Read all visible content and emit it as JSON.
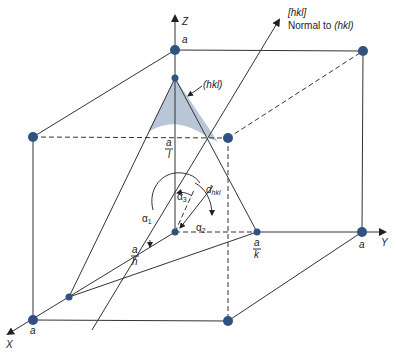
{
  "colors": {
    "node": "#2f5283",
    "plane_fill": "#b9c6d6",
    "line": "#333333",
    "background": "#ffffff"
  },
  "axes": {
    "x_label": "X",
    "y_label": "Y",
    "z_label": "Z"
  },
  "labels": {
    "a_z": "a",
    "a_x": "a",
    "a_y": "a",
    "plane": "(hkl)",
    "normal_line1": "[hkl]",
    "normal_line2_prefix": "Normal to ",
    "normal_line2_hkl": "(hkl)",
    "a_over_l_num": "a",
    "a_over_l_den": "l",
    "a_over_h_num": "a",
    "a_over_h_den": "h",
    "a_over_k_num": "a",
    "a_over_k_den": "k",
    "alpha1": "α",
    "alpha1_sub": "1",
    "alpha2": "α",
    "alpha2_sub": "2",
    "alpha3": "α",
    "alpha3_sub": "3",
    "d": "d",
    "d_sub": "hkl"
  },
  "nodes": [
    {
      "name": "origin",
      "x": 175,
      "y": 232
    },
    {
      "name": "z-a",
      "x": 175,
      "y": 50
    },
    {
      "name": "top-back-right",
      "x": 363,
      "y": 51
    },
    {
      "name": "top-front-left",
      "x": 33,
      "y": 137
    },
    {
      "name": "mid-back-right",
      "x": 228,
      "y": 138
    },
    {
      "name": "y-a",
      "x": 362,
      "y": 232
    },
    {
      "name": "x-a",
      "x": 33,
      "y": 320
    },
    {
      "name": "bottom-front-right",
      "x": 228,
      "y": 321
    },
    {
      "name": "a-over-l",
      "x": 175,
      "y": 78
    },
    {
      "name": "a-over-h",
      "x": 69,
      "y": 297
    },
    {
      "name": "a-over-k",
      "x": 257,
      "y": 232
    }
  ]
}
